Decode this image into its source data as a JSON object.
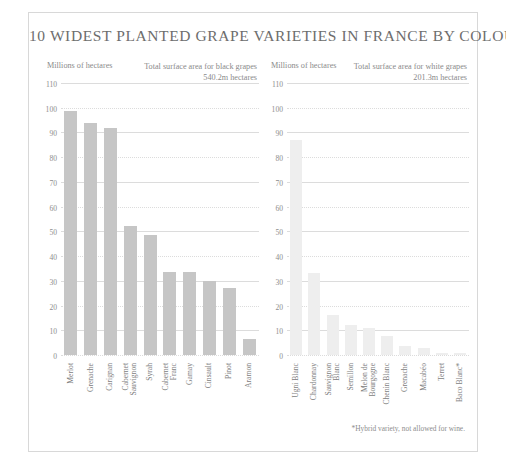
{
  "chart": {
    "title": "10 WIDEST PLANTED GRAPE VARIETIES IN FRANCE BY COLOUR",
    "footnote": "*Hybrid variety, not allowed for wine."
  },
  "panels": [
    {
      "id": "black-grapes",
      "units_label": "Millions of hectares",
      "total_label": "Total surface area for black grapes",
      "total_value": "540.2m hectares",
      "bar_color": "#c6c6c6"
    },
    {
      "id": "white-grapes",
      "units_label": "Millions of hectares",
      "total_label": "Total surface area for white grapes",
      "total_value": "201.3m hectares",
      "bar_color": "#eeeeee"
    }
  ],
  "yticks": [
    "110",
    "100",
    "90",
    "80",
    "70",
    "60",
    "50",
    "40",
    "30",
    "20",
    "10",
    "0"
  ],
  "chart_data": [
    {
      "type": "bar",
      "title": "Total surface area for black grapes",
      "subtitle": "540.2m hectares",
      "xlabel": "",
      "ylabel": "Millions of hectares",
      "ylim": [
        0,
        110
      ],
      "grid": true,
      "legend": "none",
      "categories": [
        "Merlot",
        "Grenache",
        "Carignan",
        "Cabernet Sauvignon",
        "Syrah",
        "Cabernet Franc",
        "Gamay",
        "Cinsault",
        "Pinot",
        "Aramon"
      ],
      "values": [
        98.5,
        94,
        92,
        52,
        48.5,
        33.5,
        33.5,
        30,
        27,
        6.5
      ]
    },
    {
      "type": "bar",
      "title": "Total surface area for white grapes",
      "subtitle": "201.3m hectares",
      "xlabel": "",
      "ylabel": "Millions of hectares",
      "ylim": [
        0,
        110
      ],
      "grid": true,
      "legend": "none",
      "categories": [
        "Ugni Blanc",
        "Chardonnay",
        "Sauvignon Blanc",
        "Semillon",
        "Melon de Bourgogne",
        "Chenin Blanc",
        "Grenache",
        "Macabéo",
        "Terret",
        "Baco Blanc*"
      ],
      "values": [
        87,
        33,
        16,
        12,
        11,
        7.5,
        3.5,
        3,
        1,
        0.8
      ]
    }
  ],
  "axis_labels": {
    "left": [
      {
        "l1": "Merlot",
        "l2": ""
      },
      {
        "l1": "Grenache",
        "l2": ""
      },
      {
        "l1": "Carignan",
        "l2": ""
      },
      {
        "l1": "Cabernet",
        "l2": "Sauvignon"
      },
      {
        "l1": "Syrah",
        "l2": ""
      },
      {
        "l1": "Cabernet",
        "l2": "Franc"
      },
      {
        "l1": "Gamay",
        "l2": ""
      },
      {
        "l1": "Cinsault",
        "l2": ""
      },
      {
        "l1": "Pinot",
        "l2": ""
      },
      {
        "l1": "Aramon",
        "l2": ""
      }
    ],
    "right": [
      {
        "l1": "Ugni Blanc",
        "l2": ""
      },
      {
        "l1": "Chardonnay",
        "l2": ""
      },
      {
        "l1": "Sauvignon",
        "l2": "Blanc"
      },
      {
        "l1": "Semillon",
        "l2": ""
      },
      {
        "l1": "Melon de",
        "l2": "Bourgogne"
      },
      {
        "l1": "Chenin Blanc",
        "l2": ""
      },
      {
        "l1": "Grenache",
        "l2": ""
      },
      {
        "l1": "Macabéo",
        "l2": ""
      },
      {
        "l1": "Terret",
        "l2": ""
      },
      {
        "l1": "Baco Blanc*",
        "l2": ""
      }
    ]
  }
}
